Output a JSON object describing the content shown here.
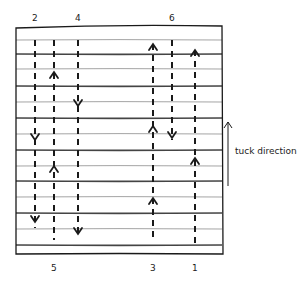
{
  "diagram": {
    "title": "",
    "frame": {
      "x1": 16,
      "y1": 26,
      "x2": 222,
      "y2": 254
    },
    "horizontal_lines": [
      {
        "y": 40,
        "weight": "thin"
      },
      {
        "y": 54,
        "weight": "thick"
      },
      {
        "y": 69,
        "weight": "thin"
      },
      {
        "y": 86,
        "weight": "thick"
      },
      {
        "y": 102,
        "weight": "thin"
      },
      {
        "y": 118,
        "weight": "thick"
      },
      {
        "y": 134,
        "weight": "thin"
      },
      {
        "y": 150,
        "weight": "thick"
      },
      {
        "y": 166,
        "weight": "thin"
      },
      {
        "y": 181,
        "weight": "thick"
      },
      {
        "y": 197,
        "weight": "thin"
      },
      {
        "y": 213,
        "weight": "thick"
      },
      {
        "y": 229,
        "weight": "thin"
      },
      {
        "y": 245,
        "weight": "thick"
      }
    ],
    "columns": [
      {
        "label": "2",
        "x": 35,
        "label_pos": "top",
        "y_start": 40,
        "y_end": 228,
        "arrows": [
          {
            "y": 140,
            "dir": "down"
          },
          {
            "y": 222,
            "dir": "down"
          }
        ]
      },
      {
        "label": "5",
        "x": 54,
        "label_pos": "bottom",
        "y_start": 40,
        "y_end": 240,
        "arrows": [
          {
            "y": 72,
            "dir": "up"
          },
          {
            "y": 166,
            "dir": "up"
          }
        ]
      },
      {
        "label": "4",
        "x": 78,
        "label_pos": "top",
        "y_start": 40,
        "y_end": 238,
        "arrows": [
          {
            "y": 106,
            "dir": "down"
          },
          {
            "y": 234,
            "dir": "down"
          }
        ]
      },
      {
        "label": "3",
        "x": 153,
        "label_pos": "bottom",
        "y_start": 44,
        "y_end": 242,
        "arrows": [
          {
            "y": 44,
            "dir": "up"
          },
          {
            "y": 126,
            "dir": "up"
          },
          {
            "y": 198,
            "dir": "up"
          }
        ]
      },
      {
        "label": "6",
        "x": 172,
        "label_pos": "top",
        "y_start": 40,
        "y_end": 140,
        "arrows": [
          {
            "y": 138,
            "dir": "down"
          }
        ]
      },
      {
        "label": "1",
        "x": 195,
        "label_pos": "bottom",
        "y_start": 50,
        "y_end": 244,
        "arrows": [
          {
            "y": 50,
            "dir": "up"
          },
          {
            "y": 158,
            "dir": "up"
          }
        ]
      }
    ],
    "tuck_direction": {
      "label": "tuck direction",
      "x": 228,
      "y_top": 122,
      "y_bottom": 186,
      "dir": "up"
    }
  },
  "colors": {
    "ink": "#1a1a1a",
    "thin_line": "#9a9a9a",
    "thick_line": "#444444",
    "background": "#ffffff"
  }
}
